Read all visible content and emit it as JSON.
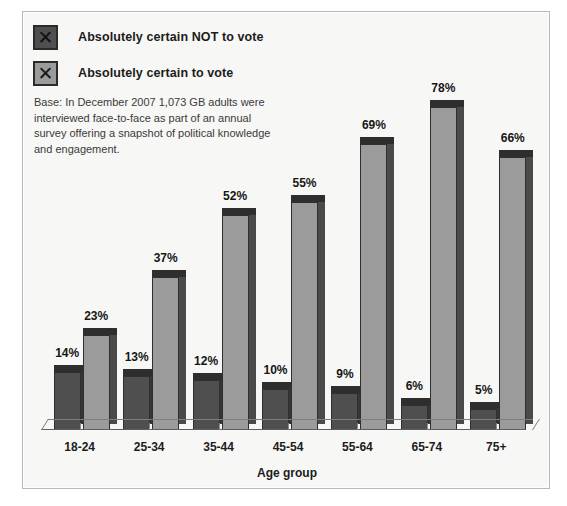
{
  "legend": {
    "items": [
      {
        "label": "Absolutely certain NOT to vote",
        "swatch_icon": "x-mark-icon",
        "color": "#4f4f4f"
      },
      {
        "label": "Absolutely certain to vote",
        "swatch_icon": "x-mark-icon",
        "color": "#9b9b9b"
      }
    ]
  },
  "base_note": "Base: In December 2007 1,073 GB adults were interviewed face-to-face as part of an annual survey offering a snapshot of political knowledge and engagement.",
  "axis": {
    "x_title": "Age group"
  },
  "chart_data": {
    "type": "bar",
    "title": "",
    "xlabel": "Age group",
    "ylabel": "",
    "ylim": [
      0,
      85
    ],
    "grid": false,
    "legend_position": "top-left",
    "categories": [
      "18-24",
      "25-34",
      "35-44",
      "45-54",
      "55-64",
      "65-74",
      "75+"
    ],
    "series": [
      {
        "name": "Absolutely certain NOT to vote",
        "color": "#4f4f4f",
        "values": [
          14,
          13,
          12,
          10,
          9,
          6,
          5
        ],
        "labels": [
          "14%",
          "13%",
          "12%",
          "10%",
          "9%",
          "6%",
          "5%"
        ]
      },
      {
        "name": "Absolutely certain to vote",
        "color": "#9b9b9b",
        "values": [
          23,
          37,
          52,
          55,
          69,
          78,
          66
        ],
        "labels": [
          "23%",
          "37%",
          "52%",
          "55%",
          "69%",
          "78%",
          "66%"
        ]
      }
    ]
  }
}
